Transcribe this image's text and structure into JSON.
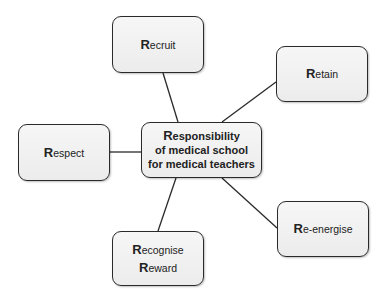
{
  "diagram": {
    "center": {
      "line1_cap": "R",
      "line1_rest": "esponsibility",
      "line2": "of medical school",
      "line3": "for medical teachers"
    },
    "nodes": {
      "recruit": {
        "cap": "R",
        "rest": "ecruit"
      },
      "retain": {
        "cap": "R",
        "rest": "etain"
      },
      "respect": {
        "cap": "R",
        "rest": "espect"
      },
      "reenergise": {
        "cap": "R",
        "rest": "e-energise"
      },
      "recognise": {
        "cap": "R",
        "rest": "ecognise"
      },
      "reward": {
        "cap": "R",
        "rest": "eward"
      }
    },
    "colors": {
      "stroke": "#2a2a2a",
      "fill": "#f0f0f0",
      "background": "#ffffff"
    }
  }
}
